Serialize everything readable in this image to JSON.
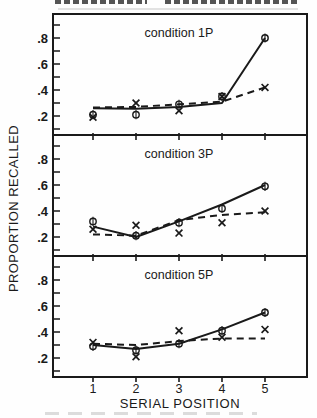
{
  "figure": {
    "ink_color": "#1a1a1a",
    "background_color": "#fefefe"
  },
  "chart_data": {
    "type": "line",
    "xlabel": "SERIAL POSITION",
    "ylabel": "PROPORTION RECALLED",
    "x": [
      1,
      2,
      3,
      4,
      5
    ],
    "x_tick_labels": [
      "1",
      "2",
      "3",
      "4",
      "5"
    ],
    "xlim": [
      0,
      6
    ],
    "y_minor_ticks": [
      0.1,
      0.2,
      0.3,
      0.4,
      0.5,
      0.6,
      0.7,
      0.8,
      0.9
    ],
    "y_labeled_ticks": [
      {
        "value": 0.2,
        "label": ".2"
      },
      {
        "value": 0.4,
        "label": ".4"
      },
      {
        "value": 0.6,
        "label": ".6"
      },
      {
        "value": 0.8,
        "label": ".8"
      }
    ],
    "ylim": [
      0.05,
      1.0
    ],
    "grid": false,
    "legend": "none",
    "panels": [
      {
        "label": "condition 1P",
        "series": [
          {
            "name": "observed-circle",
            "marker": "circle",
            "values": [
              0.21,
              0.21,
              0.29,
              0.35,
              0.8
            ]
          },
          {
            "name": "observed-x",
            "marker": "x",
            "values": [
              0.19,
              0.3,
              0.24,
              0.35,
              0.42
            ]
          },
          {
            "name": "fit-solid",
            "line": "solid",
            "values": [
              0.26,
              0.255,
              0.27,
              0.3,
              0.8
            ]
          },
          {
            "name": "fit-dashed",
            "line": "dashed",
            "values": [
              0.265,
              0.27,
              0.29,
              0.31,
              0.42
            ]
          }
        ]
      },
      {
        "label": "condition 3P",
        "series": [
          {
            "name": "observed-circle",
            "marker": "circle",
            "values": [
              0.32,
              0.21,
              0.31,
              0.42,
              0.59
            ]
          },
          {
            "name": "observed-x",
            "marker": "x",
            "values": [
              0.26,
              0.29,
              0.23,
              0.31,
              0.4
            ]
          },
          {
            "name": "fit-solid",
            "line": "solid",
            "values": [
              0.28,
              0.2,
              0.32,
              0.45,
              0.6
            ]
          },
          {
            "name": "fit-dashed",
            "line": "dashed",
            "values": [
              0.22,
              0.21,
              0.33,
              0.37,
              0.39
            ]
          }
        ]
      },
      {
        "label": "condition 5P",
        "series": [
          {
            "name": "observed-circle",
            "marker": "circle",
            "values": [
              0.29,
              0.26,
              0.31,
              0.41,
              0.55
            ]
          },
          {
            "name": "observed-x",
            "marker": "x",
            "values": [
              0.32,
              0.21,
              0.41,
              0.36,
              0.42
            ]
          },
          {
            "name": "fit-solid",
            "line": "solid",
            "values": [
              0.3,
              0.27,
              0.31,
              0.42,
              0.55
            ]
          },
          {
            "name": "fit-dashed",
            "line": "dashed",
            "values": [
              0.31,
              0.3,
              0.33,
              0.35,
              0.35
            ]
          }
        ]
      }
    ]
  }
}
